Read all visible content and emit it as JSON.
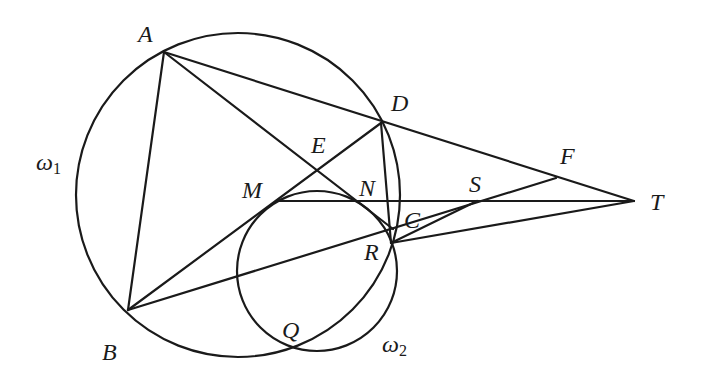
{
  "diagram": {
    "type": "geometry",
    "stroke_color": "#1a1a1a",
    "background": "#ffffff",
    "points": {
      "A": {
        "label": "A",
        "x": 164,
        "y": 52
      },
      "B": {
        "label": "B",
        "x": 128,
        "y": 310
      },
      "C": {
        "label": "C",
        "x": 393,
        "y": 229
      },
      "D": {
        "label": "D",
        "x": 381,
        "y": 123
      },
      "E": {
        "label": "E",
        "x": 317,
        "y": 171
      },
      "F": {
        "label": "F",
        "x": 556,
        "y": 178
      },
      "M": {
        "label": "M",
        "x": 276,
        "y": 201
      },
      "N": {
        "label": "N",
        "x": 358,
        "y": 201
      },
      "Q": {
        "label": "Q",
        "x": 293,
        "y": 345
      },
      "R": {
        "label": "R",
        "x": 391,
        "y": 243
      },
      "S": {
        "label": "S",
        "x": 477,
        "y": 201
      },
      "T": {
        "label": "T",
        "x": 634,
        "y": 201
      }
    },
    "circles": [
      {
        "name": "omega1",
        "label_main": "ω",
        "label_sub": "1",
        "cx": 238,
        "cy": 195,
        "r": 162
      },
      {
        "name": "omega2",
        "label_main": "ω",
        "label_sub": "2",
        "cx": 317,
        "cy": 271,
        "r": 80
      }
    ],
    "segments": [
      [
        "A",
        "B"
      ],
      [
        "A",
        "T"
      ],
      [
        "A",
        "C"
      ],
      [
        "B",
        "D"
      ],
      [
        "B",
        "F"
      ],
      [
        "M",
        "T"
      ],
      [
        "D",
        "R"
      ],
      [
        "R",
        "S"
      ],
      [
        "R",
        "T"
      ]
    ]
  }
}
